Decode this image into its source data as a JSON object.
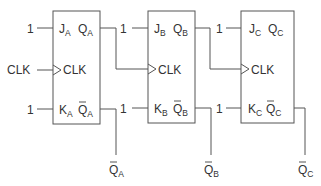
{
  "diagram": {
    "clock_input_label": "CLK",
    "flipflops": [
      {
        "id": "A",
        "j_input": "1",
        "k_input": "1",
        "j_label": "J",
        "j_sub": "A",
        "q_label": "Q",
        "q_sub": "A",
        "clk_label": "CLK",
        "k_label": "K",
        "k_sub": "A",
        "qbar_label": "Q",
        "qbar_sub": "A",
        "output_label": "Q",
        "output_sub": "A"
      },
      {
        "id": "B",
        "j_input": "1",
        "k_input": "1",
        "j_label": "J",
        "j_sub": "B",
        "q_label": "Q",
        "q_sub": "B",
        "clk_label": "CLK",
        "k_label": "K",
        "k_sub": "B",
        "qbar_label": "Q",
        "qbar_sub": "B",
        "output_label": "Q",
        "output_sub": "B"
      },
      {
        "id": "C",
        "j_input": "1",
        "k_input": "1",
        "j_label": "J",
        "j_sub": "C",
        "q_label": "Q",
        "q_sub": "C",
        "clk_label": "CLK",
        "k_label": "K",
        "k_sub": "C",
        "qbar_label": "Q",
        "qbar_sub": "C",
        "output_label": "Q",
        "output_sub": "C"
      }
    ],
    "colors": {
      "line": "#555555",
      "text": "#333333",
      "background": "#ffffff"
    }
  }
}
